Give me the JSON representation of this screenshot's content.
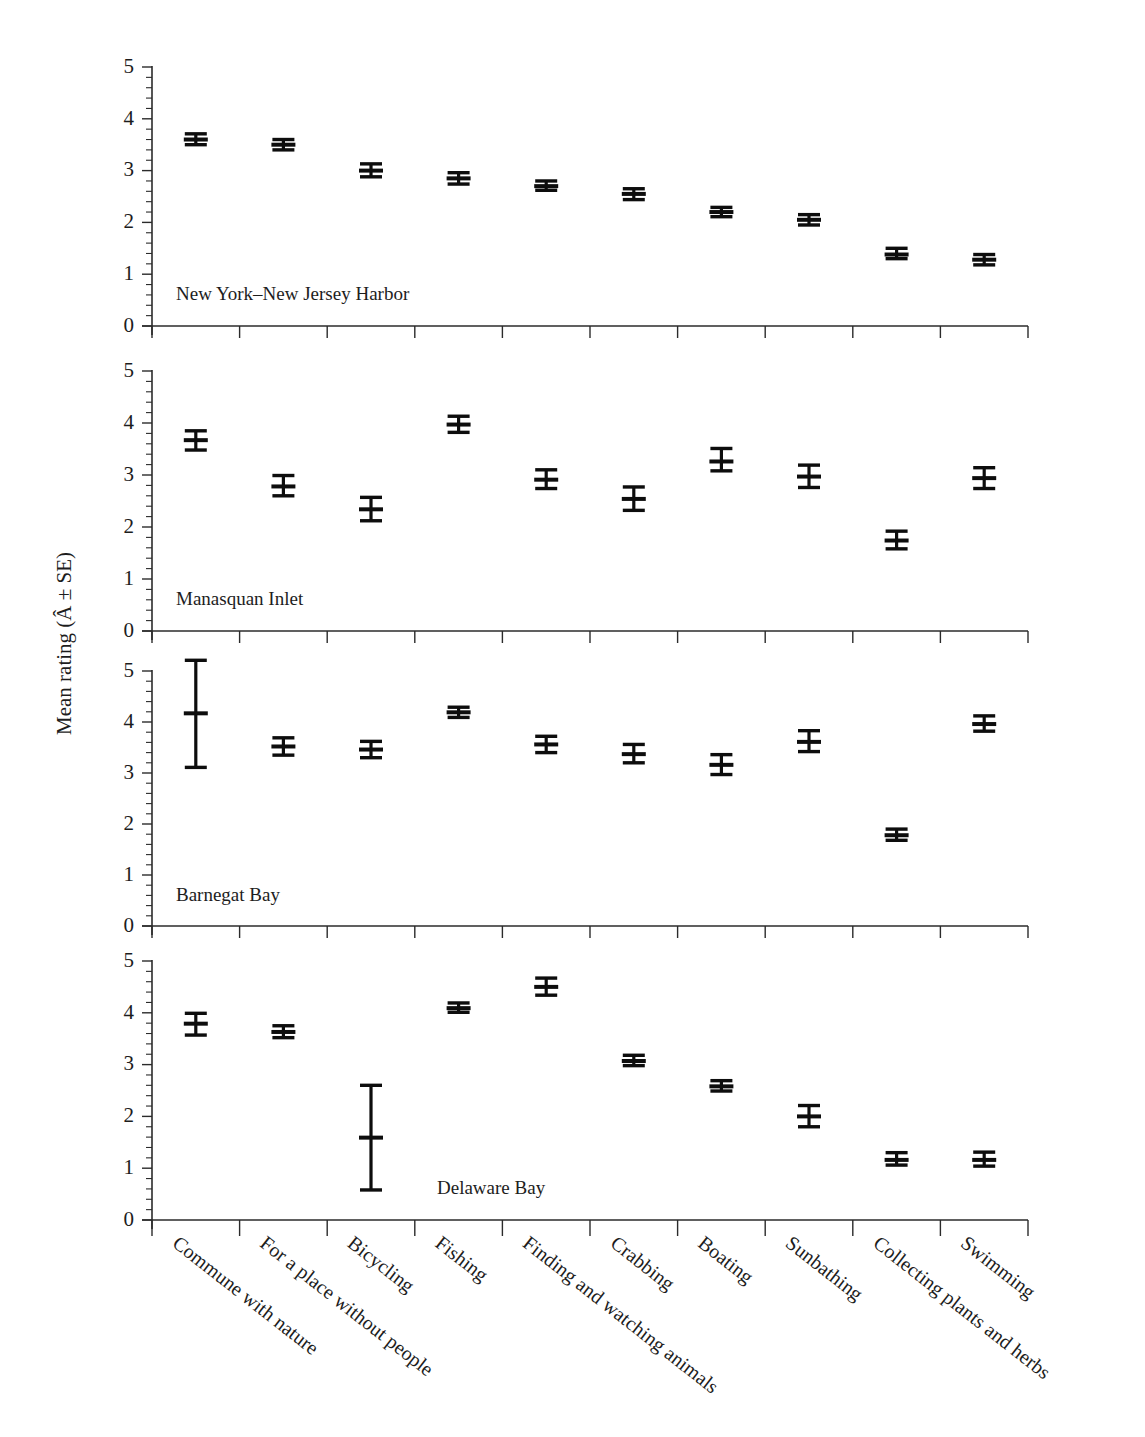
{
  "figure": {
    "axis_title_y": "Mean rating (Â ± SE)",
    "y_tick_labels": [
      "0",
      "1",
      "2",
      "3",
      "4",
      "5"
    ]
  },
  "chart_data": {
    "type": "scatter",
    "title": "",
    "xlabel": "",
    "ylabel": "Mean rating (Â ± SE)",
    "ylim": [
      0,
      5
    ],
    "yticks": [
      0,
      1,
      2,
      3,
      4,
      5
    ],
    "grid": false,
    "legend": "none",
    "error_type": "standard error (SE)",
    "categories": [
      "Commune with nature",
      "For a place without people",
      "Bicycling",
      "Fishing",
      "Finding and watching animals",
      "Crabbing",
      "Boating",
      "Sunbathing",
      "Collecting plants and herbs",
      "Swimming"
    ],
    "panels": [
      {
        "name": "New York–New Jersey Harbor",
        "values": [
          3.6,
          3.5,
          3.0,
          2.85,
          2.7,
          2.55,
          2.2,
          2.05,
          1.38,
          1.28
        ],
        "err_low": [
          3.5,
          3.4,
          2.88,
          2.74,
          2.62,
          2.44,
          2.11,
          1.95,
          1.3,
          1.18
        ],
        "err_high": [
          3.71,
          3.6,
          3.13,
          2.96,
          2.8,
          2.65,
          2.29,
          2.15,
          1.5,
          1.38
        ]
      },
      {
        "name": "Manasquan Inlet",
        "values": [
          3.67,
          2.78,
          2.34,
          3.97,
          2.91,
          2.54,
          3.26,
          2.97,
          1.74,
          2.94
        ],
        "err_low": [
          3.48,
          2.6,
          2.12,
          3.82,
          2.74,
          2.32,
          3.08,
          2.76,
          1.58,
          2.74
        ],
        "err_high": [
          3.85,
          2.99,
          2.57,
          4.13,
          3.1,
          2.77,
          3.51,
          3.19,
          1.92,
          3.14
        ]
      },
      {
        "name": "Barnegat Bay",
        "values": [
          4.17,
          3.52,
          3.46,
          4.19,
          3.56,
          3.37,
          3.16,
          3.61,
          1.78,
          3.96
        ],
        "err_low": [
          3.11,
          3.35,
          3.3,
          4.09,
          3.4,
          3.2,
          2.97,
          3.42,
          1.68,
          3.82
        ],
        "err_high": [
          5.21,
          3.69,
          3.62,
          4.29,
          3.72,
          3.56,
          3.36,
          3.83,
          1.9,
          4.12
        ]
      },
      {
        "name": "Delaware Bay",
        "values": [
          3.79,
          3.63,
          1.59,
          4.09,
          4.5,
          3.07,
          2.58,
          2.0,
          1.16,
          1.16
        ],
        "err_low": [
          3.57,
          3.52,
          0.58,
          4.01,
          4.34,
          2.98,
          2.49,
          1.8,
          1.06,
          1.04
        ],
        "err_high": [
          3.99,
          3.75,
          2.6,
          4.19,
          4.67,
          3.18,
          2.69,
          2.21,
          1.3,
          1.31
        ]
      }
    ]
  }
}
